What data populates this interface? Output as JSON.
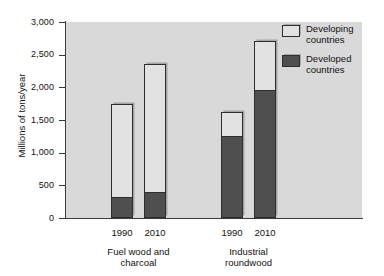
{
  "chart_data": {
    "type": "bar",
    "subtype": "stacked-bar-grouped",
    "title": "",
    "xlabel": "",
    "ylabel": "Millions of tons/year",
    "ylim": [
      0,
      3000
    ],
    "ytick_values": [
      0,
      500,
      1000,
      1500,
      2000,
      2500,
      3000
    ],
    "ytick_labels": [
      "0",
      "500",
      "1,000",
      "1,500",
      "2,000",
      "2,500",
      "3,000"
    ],
    "grid": false,
    "legend_position": "top-right",
    "categories": [
      "1990",
      "2010",
      "1990",
      "2010"
    ],
    "groups": [
      {
        "label": "Fuel wood and\ncharcoal",
        "label_line1": "Fuel wood and",
        "label_line2": "charcoal",
        "categories": [
          "1990",
          "2010"
        ]
      },
      {
        "label": "Industrial\nroundwood",
        "label_line1": "Industrial",
        "label_line2": "roundwood",
        "categories": [
          "1990",
          "2010"
        ]
      }
    ],
    "series": [
      {
        "name": "Developed countries",
        "color": "#4f4f4f",
        "values": [
          300,
          380,
          1240,
          1940
        ]
      },
      {
        "name": "Developing countries",
        "color": "#e2e2e2",
        "values": [
          1450,
          1970,
          390,
          770
        ]
      }
    ],
    "totals": [
      1750,
      2350,
      1630,
      2710
    ],
    "bars": [
      {
        "group": "Fuel wood and charcoal",
        "year": "1990",
        "developed": 300,
        "developing": 1450,
        "total": 1750
      },
      {
        "group": "Fuel wood and charcoal",
        "year": "2010",
        "developed": 380,
        "developing": 1970,
        "total": 2350
      },
      {
        "group": "Industrial roundwood",
        "year": "1990",
        "developed": 1240,
        "developing": 390,
        "total": 1630
      },
      {
        "group": "Industrial roundwood",
        "year": "2010",
        "developed": 1940,
        "developing": 770,
        "total": 2710
      }
    ]
  },
  "axis": {
    "ylabel": "Millions of tons/year",
    "yticks": [
      {
        "value": 3000,
        "label": "3,000"
      },
      {
        "value": 2500,
        "label": "2,500"
      },
      {
        "value": 2000,
        "label": "2,000"
      },
      {
        "value": 1500,
        "label": "1,500"
      },
      {
        "value": 1000,
        "label": "1,000"
      },
      {
        "value": 500,
        "label": "500"
      },
      {
        "value": 0,
        "label": "0"
      }
    ],
    "xticks": [
      {
        "label": "1990"
      },
      {
        "label": "2010"
      },
      {
        "label": "1990"
      },
      {
        "label": "2010"
      }
    ],
    "group_labels": [
      {
        "line1": "Fuel wood and",
        "line2": "charcoal"
      },
      {
        "line1": "Industrial",
        "line2": "roundwood"
      }
    ]
  },
  "legend": {
    "items": [
      {
        "label": "Developing\ncountries",
        "swatch": "developing-swatch",
        "color": "#e2e2e2"
      },
      {
        "label": "Developed\ncountries",
        "swatch": "developed-swatch",
        "color": "#4f4f4f"
      }
    ]
  },
  "colors": {
    "plot_background": "#d9d9d9",
    "page_background": "#ffffff",
    "axis": "#3a3a3a",
    "developing": "#e2e2e2",
    "developed": "#4f4f4f",
    "bar_outline": "#2e2e2e"
  }
}
